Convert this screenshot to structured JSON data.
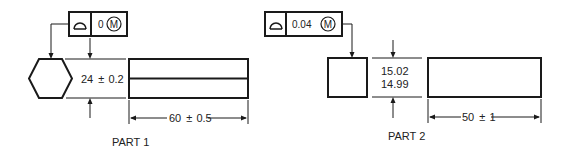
{
  "diagram": {
    "type": "engineering-drawing",
    "colors": {
      "line": "#1a1a1a",
      "text": "#222222",
      "background": "#ffffff"
    }
  },
  "part1": {
    "label": "PART 1",
    "feature_control_frame": {
      "symbol": "profile-of-a-line-icon",
      "tolerance": "0",
      "modifier": "M"
    },
    "cross_section_shape": "hexagon",
    "size_dimension": {
      "value": "24",
      "pm": "±",
      "tol": "0.2",
      "text": "24 ± 0.2"
    },
    "length_dimension": {
      "value": "60",
      "pm": "±",
      "tol": "0.5",
      "text": "60 ± 0.5"
    }
  },
  "part2": {
    "label": "PART 2",
    "feature_control_frame": {
      "symbol": "profile-of-a-line-icon",
      "tolerance": "0.04",
      "modifier": "M"
    },
    "cross_section_shape": "square",
    "size_dimension": {
      "upper": "15.02",
      "lower": "14.99"
    },
    "length_dimension": {
      "value": "50",
      "pm": "±",
      "tol": "1",
      "text": "50 ± 1"
    }
  }
}
